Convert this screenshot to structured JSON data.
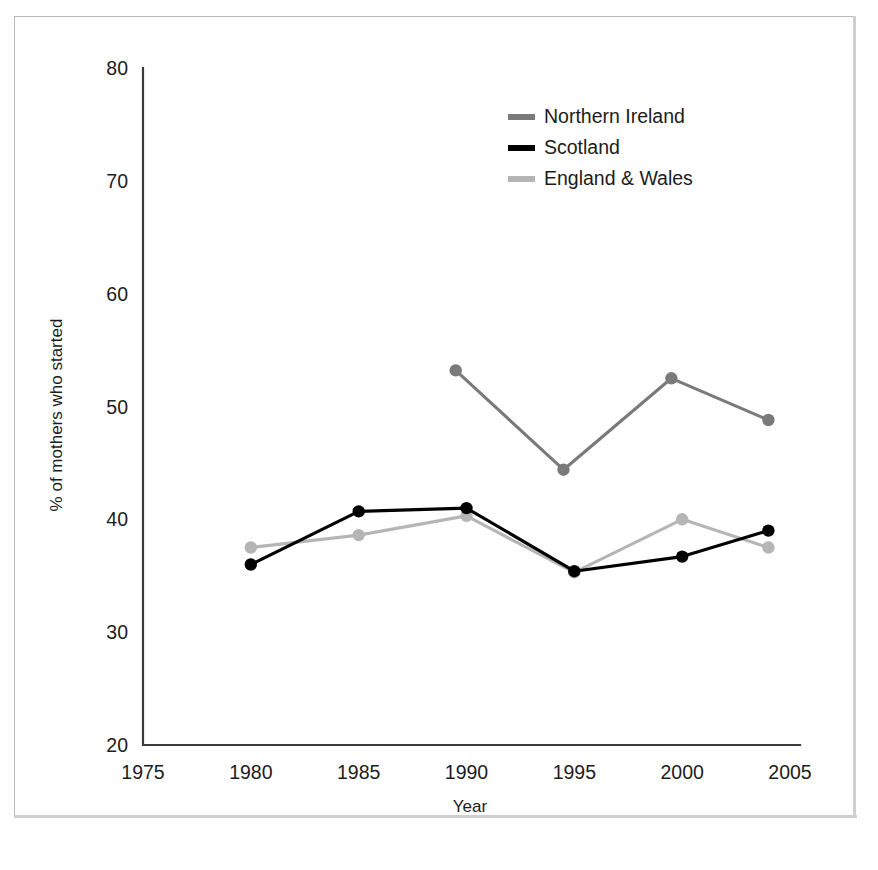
{
  "figure": {
    "frame_color": "#b9b9b9",
    "top_rule_color": "#6e6e6e",
    "background": "#ffffff"
  },
  "axis": {
    "y_title": "% of mothers who started",
    "x_title": "Year",
    "y_ticks": [
      "80",
      "70",
      "60",
      "50",
      "40",
      "30",
      "20"
    ],
    "x_ticks": [
      "1975",
      "1980",
      "1985",
      "1990",
      "1995",
      "2000",
      "2005"
    ],
    "axis_color": "#3b3b3b"
  },
  "legend": {
    "entries": [
      {
        "label": "Northern Ireland",
        "color": "#7a7a7a"
      },
      {
        "label": "Scotland",
        "color": "#000000"
      },
      {
        "label": "England & Wales",
        "color": "#b5b5b5"
      }
    ]
  },
  "chart_data": {
    "type": "line",
    "title": "",
    "xlabel": "Year",
    "ylabel": "% of mothers who started",
    "xlim": [
      1975,
      2005
    ],
    "ylim": [
      20,
      80
    ],
    "xticks": [
      1975,
      1980,
      1985,
      1990,
      1995,
      2000,
      2005
    ],
    "yticks": [
      20,
      30,
      40,
      50,
      60,
      70,
      80
    ],
    "grid": false,
    "legend_position": "top-right",
    "series": [
      {
        "name": "Northern Ireland",
        "color": "#7a7a7a",
        "x": [
          1989.5,
          1994.5,
          1999.5,
          2004.0
        ],
        "values": [
          53.2,
          44.4,
          52.5,
          48.8
        ]
      },
      {
        "name": "Scotland",
        "color": "#000000",
        "x": [
          1980.0,
          1985.0,
          1990.0,
          1995.0,
          2000.0,
          2004.0
        ],
        "values": [
          36.0,
          40.7,
          41.0,
          35.4,
          36.7,
          39.0
        ]
      },
      {
        "name": "England & Wales",
        "color": "#b5b5b5",
        "x": [
          1980.0,
          1985.0,
          1990.0,
          1995.0,
          2000.0,
          2004.0
        ],
        "values": [
          37.5,
          38.6,
          40.3,
          35.3,
          40.0,
          37.5
        ]
      }
    ]
  }
}
